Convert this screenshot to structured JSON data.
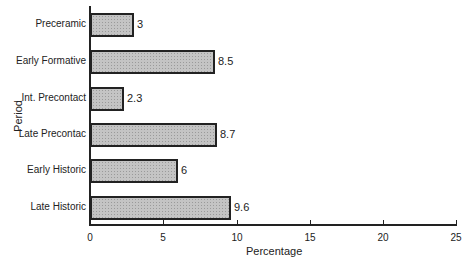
{
  "chart_data": {
    "type": "bar",
    "orientation": "horizontal",
    "title": "",
    "xlabel": "Percentage",
    "ylabel": "Period",
    "categories": [
      "Preceramic",
      "Early Formative",
      "Int. Precontact",
      "Late Precontac",
      "Early Historic",
      "Late Historic"
    ],
    "values": [
      3,
      8.5,
      2.3,
      8.7,
      6,
      9.6
    ],
    "value_labels": [
      "3",
      "8.5",
      "2.3",
      "8.7",
      "6",
      "9.6"
    ],
    "xlim": [
      0,
      25
    ],
    "xticks": [
      "0",
      "5",
      "10",
      "15",
      "20",
      "25"
    ],
    "grid": false,
    "legend": null,
    "bar_fill": "#c4c4c4",
    "bar_edge": "#222222"
  }
}
